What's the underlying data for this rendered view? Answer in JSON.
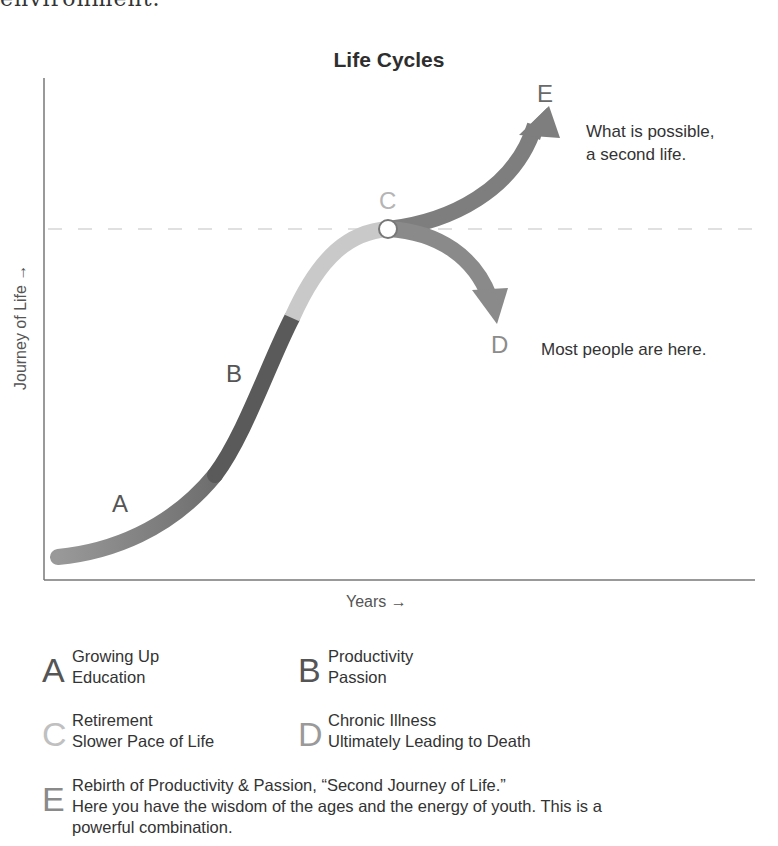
{
  "page": {
    "cut_off_text": "environment."
  },
  "diagram": {
    "title": "Life Cycles",
    "y_axis_label": "Journey of Life →",
    "x_axis_label": "Years →",
    "points": {
      "A": {
        "label": "A",
        "color": "#7a7a7a"
      },
      "B": {
        "label": "B",
        "color": "#555555"
      },
      "C": {
        "label": "C",
        "color": "#b5b5b5"
      },
      "D": {
        "label": "D",
        "color": "#8c8c8c"
      },
      "E": {
        "label": "E",
        "color": "#6a6a6a"
      }
    },
    "annotations": {
      "e_note_line1": "What is possible,",
      "e_note_line2": "a second life.",
      "d_note": "Most people are here."
    },
    "colors": {
      "stage_a": "#8a8a8a",
      "stage_b": "#5c5c5c",
      "stage_c": "#c8c8c8",
      "stage_d": "#8e8e8e",
      "stage_e": "#7e7e7e",
      "axis": "#777777",
      "dashed_line": "#dddddd"
    }
  },
  "legend": [
    {
      "letter": "A",
      "line1": "Growing Up",
      "line2": "Education",
      "color": "#555555"
    },
    {
      "letter": "B",
      "line1": "Productivity",
      "line2": "Passion",
      "color": "#555555"
    },
    {
      "letter": "C",
      "line1": "Retirement",
      "line2": "Slower Pace of Life",
      "color": "#c0c0c0"
    },
    {
      "letter": "D",
      "line1": "Chronic Illness",
      "line2": "Ultimately Leading to Death",
      "color": "#9a9a9a"
    },
    {
      "letter": "E",
      "line1": "Rebirth of Productivity & Passion, “Second Journey of Life.”",
      "line2": "Here you have the wisdom of the ages and the energy of youth. This is a",
      "line3": "powerful combination.",
      "color": "#8a8a8a"
    }
  ]
}
